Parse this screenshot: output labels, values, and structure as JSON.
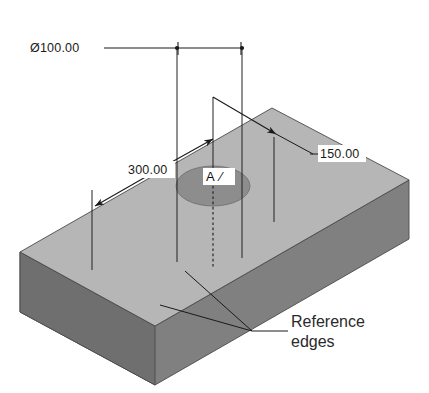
{
  "drawing": {
    "title": "Isometric block with through hole dimensioning",
    "background_color": "#ffffff",
    "solid": {
      "name": "rectangular-block",
      "top_face_color": "#b6b6b6",
      "front_face_color": "#808080",
      "left_face_color": "#757575",
      "hole_face_color": "#8d8d8d",
      "edge_color": "#4a4a4a"
    },
    "dimensions": [
      {
        "id": "diameter",
        "label": "Ø100.00",
        "symbol": "diameter-symbol",
        "value": "100.00",
        "type": "linear-aligned-top"
      },
      {
        "id": "left-offset",
        "label": "300.00",
        "value": "300.00",
        "type": "ordinate-leader"
      },
      {
        "id": "right-offset",
        "label": "150.00",
        "value": "150.00",
        "type": "ordinate-leader"
      }
    ],
    "hole": {
      "name": "through-hole",
      "label": "A",
      "annotation_suffix": "⁄"
    },
    "notes": [
      {
        "id": "reference-edges",
        "line1": "Reference",
        "line2": "edges"
      }
    ]
  }
}
